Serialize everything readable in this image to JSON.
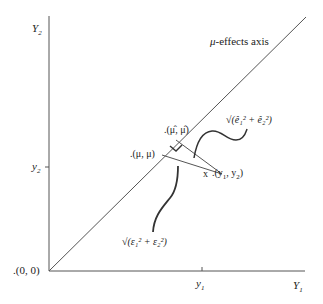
{
  "axes": {
    "x_label": "Y",
    "x_label_sub": "1",
    "y_label": "Y",
    "y_label_sub": "2",
    "origin_label": ".(0, 0)",
    "x_tick_label": "y",
    "x_tick_sub": "1",
    "y_tick_label": "y",
    "y_tick_sub": "2"
  },
  "diagonal": {
    "label_mu": "μ",
    "label_rest": "-effects axis"
  },
  "points": {
    "mu_hat": ".(μ̂, μ̂)",
    "mu": ".(μ, μ)",
    "y_marker": "x",
    "y": ".(y",
    "y_sub1": "1",
    "y_mid": ", y",
    "y_sub2": "2",
    "y_close": ")"
  },
  "annotations": {
    "residual_norm": "√(ê₁² + ê₂²)",
    "error_norm": "√(ε₁² + ε₂²)"
  },
  "colors": {
    "line": "#555555",
    "text": "#222222"
  }
}
